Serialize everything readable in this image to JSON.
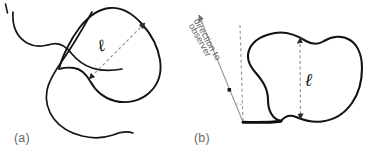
{
  "figure": {
    "type": "scientific-diagram",
    "background_color": "#ffffff",
    "width": 369,
    "height": 158,
    "stroke_color": "#111111",
    "dashed_color": "#8c8c8c",
    "label_color": "#6a6a6a"
  },
  "panels": [
    {
      "id": "a",
      "label": "(a)",
      "description": "Irregular closed blob crossed by a wavy open curve, with a diagonal dashed double-arrow measuring the blob extent",
      "measure_label": "ℓ",
      "measure_orientation": "diagonal"
    },
    {
      "id": "b",
      "label": "(b)",
      "description": "Irregular closed blob resting on a dark horizontal shadow line, with a vertical dashed double-arrow measuring the blob height, plus an inclined sight line to the observer and an angle marker",
      "measure_label": "ℓ",
      "measure_orientation": "vertical"
    }
  ],
  "annotations": {
    "observer_text_line_1": "direction to",
    "observer_text_line_2": "observer",
    "angle_marker": "•"
  }
}
